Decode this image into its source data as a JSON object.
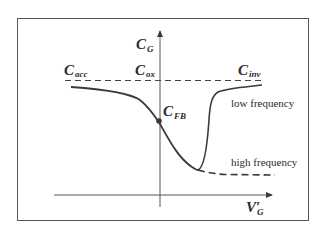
{
  "diagram": {
    "type": "C-V curve diagram (MOS capacitance vs gate voltage)",
    "y_axis": {
      "symbol": "C",
      "subscript": "G"
    },
    "x_axis": {
      "symbol": "V′",
      "subscript": "G"
    },
    "reference_line": {
      "style": "dashed",
      "labels": [
        {
          "symbol": "C",
          "subscript": "acc"
        },
        {
          "symbol": "C",
          "subscript": "ox"
        },
        {
          "symbol": "C",
          "subscript": "inv"
        }
      ]
    },
    "point": {
      "symbol": "C",
      "subscript": "FB"
    },
    "curves": [
      {
        "name": "low frequency",
        "style": "solid"
      },
      {
        "name": "high frequency",
        "style": "dashed"
      }
    ]
  },
  "colors": {
    "line": "#3a3a3a",
    "frame": "#555555",
    "background": "#ffffff"
  }
}
